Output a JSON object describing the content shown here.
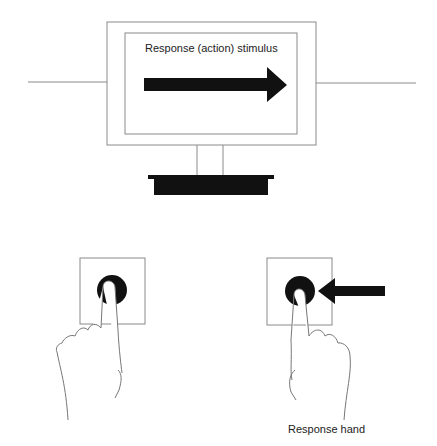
{
  "monitor": {
    "stimulus_label": "Response (action) stimulus",
    "arrow_direction": "right"
  },
  "response_hand": {
    "label": "Response hand",
    "arrow_direction": "left"
  },
  "colors": {
    "line": "#8a8a8a",
    "fill": "#111111",
    "background": "#ffffff"
  }
}
